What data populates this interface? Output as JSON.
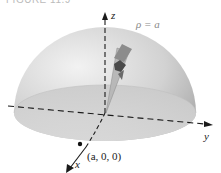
{
  "figure": {
    "caption": "FIGURE 11.9",
    "surface_label": "ρ = a",
    "axes": {
      "x": "x",
      "y": "y",
      "z": "z"
    },
    "point_label": "(a, 0, 0)",
    "colors": {
      "hemisphere_light": "#e4e4e4",
      "hemisphere_dark": "#9c9c9c",
      "base": "#cfcfcf",
      "wedge": "#8f8f8f",
      "axis": "#1a1a1a"
    }
  }
}
